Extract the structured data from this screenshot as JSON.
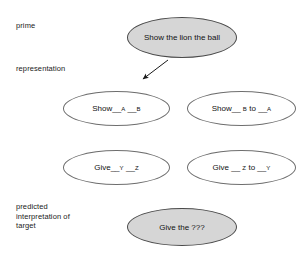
{
  "diagram": {
    "stage_labels": {
      "prime": "prime",
      "representation": "representation",
      "target": "predicted\ninterpretation of\ntarget"
    },
    "nodes": {
      "prime": {
        "text": "Show the lion the ball",
        "style": "filled",
        "fill": "#d6d6d6"
      },
      "rep_double_object": {
        "prefix": "Show__",
        "arg1": "A",
        "mid": " __",
        "arg2": "B",
        "style": "hollow"
      },
      "rep_prepositional": {
        "prefix": "Show__ ",
        "arg1": "B",
        "mid": " to __",
        "arg2": "A",
        "style": "hollow"
      },
      "rep_give_double_object": {
        "prefix": "Give__",
        "arg1": "Y",
        "mid": " __",
        "arg2": "Z",
        "style": "hollow"
      },
      "rep_give_prepositional": {
        "prefix": "Give __ ",
        "arg1": "Z",
        "mid": " to __",
        "arg2": "Y",
        "style": "hollow"
      },
      "target": {
        "text": "Give the ???",
        "style": "filled",
        "fill": "#d6d6d6"
      }
    },
    "arrow": {
      "name": "prime-to-representation-arrow",
      "from_x": 168,
      "from_y": 60,
      "to_x": 141,
      "to_y": 81,
      "color": "#1a1a1a"
    }
  }
}
